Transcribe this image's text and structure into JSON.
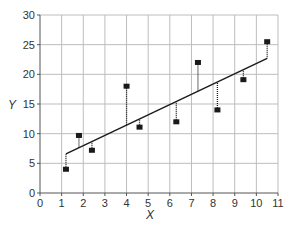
{
  "chart_data": {
    "type": "scatter",
    "title": "",
    "xlabel": "X",
    "ylabel": "Y",
    "xlim": [
      0,
      11
    ],
    "ylim": [
      0,
      30
    ],
    "x_ticks": [
      0,
      1,
      2,
      3,
      4,
      5,
      6,
      7,
      8,
      9,
      10,
      11
    ],
    "y_ticks": [
      0,
      5,
      10,
      15,
      20,
      25,
      30
    ],
    "grid": true,
    "legend": null,
    "series": [
      {
        "name": "observed",
        "marker": "square",
        "points": [
          {
            "x": 1.2,
            "y": 4.0
          },
          {
            "x": 1.8,
            "y": 9.7
          },
          {
            "x": 2.4,
            "y": 7.2
          },
          {
            "x": 4.0,
            "y": 18.0
          },
          {
            "x": 4.6,
            "y": 11.1
          },
          {
            "x": 6.3,
            "y": 12.0
          },
          {
            "x": 7.3,
            "y": 22.0
          },
          {
            "x": 8.2,
            "y": 14.0
          },
          {
            "x": 9.4,
            "y": 19.1
          },
          {
            "x": 10.5,
            "y": 25.5
          }
        ]
      },
      {
        "name": "regression line",
        "type": "line",
        "points": [
          {
            "x": 1.2,
            "y": 6.6
          },
          {
            "x": 10.5,
            "y": 22.7
          }
        ]
      }
    ],
    "annotations": "Dotted vertical residual lines connect each observed point to the fitted regression line",
    "colors": {
      "marker": "#1a1a1a",
      "line": "#1a1a1a",
      "grid": "#bdbdbd",
      "axis": "#555555"
    }
  }
}
